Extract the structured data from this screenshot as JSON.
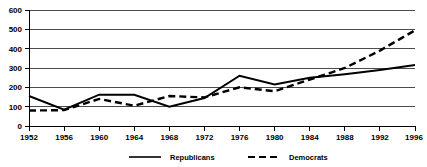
{
  "chart_data": {
    "type": "line",
    "title": "",
    "subtitle": "",
    "xlabel": "",
    "ylabel": "",
    "x": [
      1952,
      1956,
      1960,
      1964,
      1968,
      1972,
      1976,
      1980,
      1984,
      1988,
      1992,
      1996
    ],
    "categories": [
      "1952",
      "1956",
      "1960",
      "1964",
      "1968",
      "1972",
      "1976",
      "1980",
      "1984",
      "1988",
      "1992",
      "1996"
    ],
    "xtick_labels": [
      "1952",
      "1956",
      "1960",
      "1964",
      "1968",
      "1972",
      "1976",
      "1980",
      "1984",
      "1988",
      "1992",
      "1996"
    ],
    "ytick_labels": [
      "0",
      "100",
      "200",
      "300",
      "400",
      "500",
      "600"
    ],
    "ytick_values": [
      0,
      100,
      200,
      300,
      400,
      500,
      600
    ],
    "ylim": [
      0,
      600
    ],
    "xlim": [
      1952,
      1996
    ],
    "grid": true,
    "grid_axis": "y",
    "legend_position": "bottom-center",
    "series": [
      {
        "name": "Republicans",
        "style": "solid",
        "color": "#000000",
        "values": [
          155,
          85,
          162,
          162,
          100,
          145,
          260,
          215,
          250,
          268,
          290,
          315
        ]
      },
      {
        "name": "Democrats",
        "style": "dashed",
        "color": "#000000",
        "values": [
          80,
          82,
          140,
          105,
          155,
          148,
          200,
          180,
          240,
          300,
          390,
          495
        ]
      }
    ]
  },
  "legend": {
    "entries": [
      {
        "label": "Republicans",
        "style": "solid"
      },
      {
        "label": "Democrats",
        "style": "dashed"
      }
    ]
  },
  "axes": {
    "y_labels": [
      "600",
      "500",
      "400",
      "300",
      "200",
      "100",
      "0"
    ],
    "x_labels": [
      "1952",
      "1956",
      "1960",
      "1964",
      "1968",
      "1972",
      "1976",
      "1980",
      "1984",
      "1988",
      "1992",
      "1996"
    ]
  }
}
